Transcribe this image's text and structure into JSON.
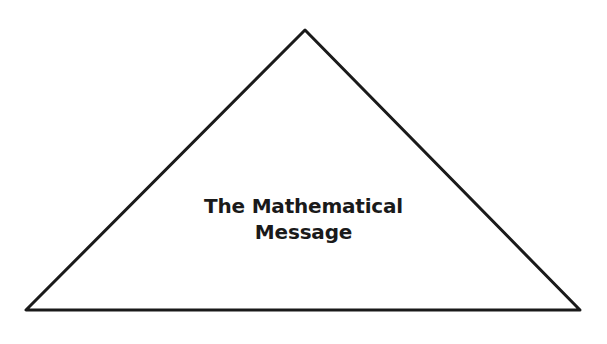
{
  "diagram": {
    "shape": "triangle",
    "stroke_color": "#1a1a1a",
    "fill_color": "#ffffff",
    "label_lines": [
      "The Mathematical",
      "Message"
    ],
    "label": "The Mathematical Message"
  }
}
